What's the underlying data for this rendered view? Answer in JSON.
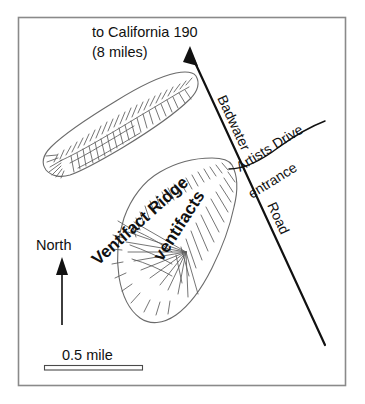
{
  "map": {
    "title_line1": "to California 190",
    "title_line2": "(8 miles)",
    "compass_label": "North",
    "scale_label": "0.5 mile",
    "roads": {
      "main_road_name_part1": "Badwater",
      "main_road_name_part2": "Road",
      "branch_name": "Artists Drive",
      "branch_sublabel": "entrance"
    },
    "landforms": {
      "ridge_label": "Ventifact Ridge",
      "feature_label": "ventifacts"
    },
    "colors": {
      "frame_stroke": "#8a8a8a",
      "landform_stroke": "#6b6b6b",
      "hachure_stroke": "#5c5c5c",
      "road_stroke": "#111111",
      "text": "#111111",
      "background": "#ffffff"
    }
  }
}
